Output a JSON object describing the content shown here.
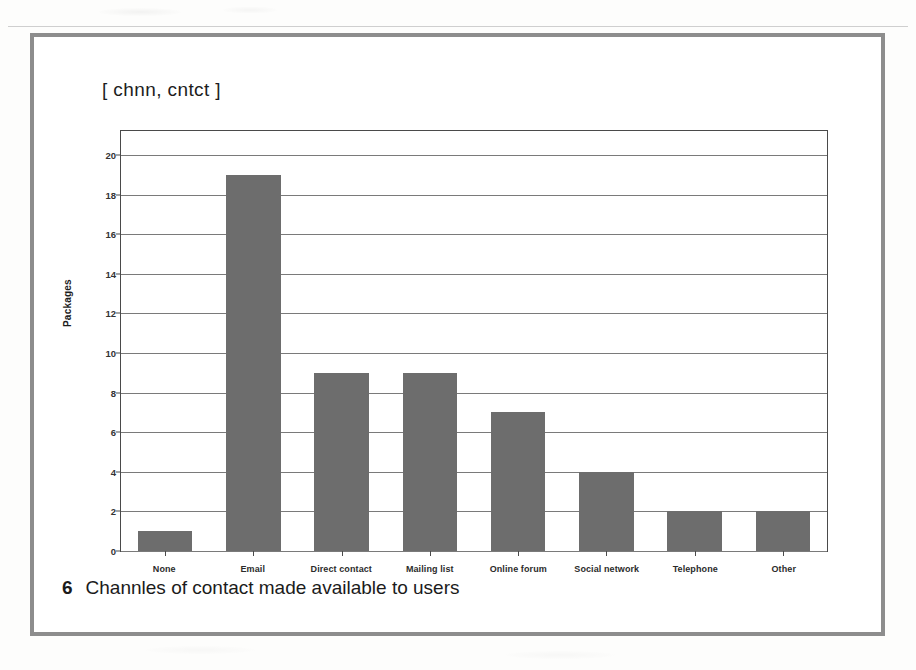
{
  "figure": {
    "title": "[ chnn, cntct ]",
    "caption_number": "6",
    "caption_text": "Channles of contact made available to users"
  },
  "chart_data": {
    "type": "bar",
    "title": "[ chnn, cntct ]",
    "categories": [
      "None",
      "Email",
      "Direct contact",
      "Mailing list",
      "Online forum",
      "Social network",
      "Telephone",
      "Other"
    ],
    "values": [
      1,
      19,
      9,
      9,
      7,
      4,
      2,
      2
    ],
    "xlabel": "",
    "ylabel": "Packages",
    "ylim": [
      0,
      20
    ],
    "ytick_step": 2,
    "yticks": [
      "0",
      "2",
      "4",
      "6",
      "8",
      "10",
      "12",
      "14",
      "16",
      "18",
      "20"
    ],
    "grid": true,
    "legend": false,
    "bar_color": "#6d6d6d",
    "axis_color": "#4a4a4a",
    "gridline_color": "#7a7a7a"
  }
}
